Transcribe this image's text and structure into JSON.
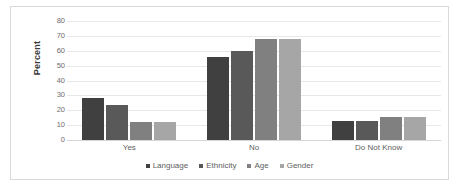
{
  "chart_data": {
    "type": "bar",
    "title": "",
    "subtitle": "",
    "xlabel": "",
    "ylabel": "Percent",
    "ylim": [
      0,
      80
    ],
    "yticks": [
      80,
      70,
      60,
      50,
      40,
      30,
      20,
      10,
      0
    ],
    "grid": true,
    "legend_position": "bottom",
    "categories": [
      "Yes",
      "No",
      "Do Not Know"
    ],
    "series": [
      {
        "name": "Language",
        "color": "#404040",
        "values": [
          28,
          56,
          13
        ]
      },
      {
        "name": "Ethnicity",
        "color": "#595959",
        "values": [
          23.5,
          60,
          13
        ]
      },
      {
        "name": "Age",
        "color": "#808080",
        "values": [
          12,
          68,
          15.5
        ]
      },
      {
        "name": "Gender",
        "color": "#a6a6a6",
        "values": [
          12,
          68,
          15.5
        ]
      }
    ]
  }
}
